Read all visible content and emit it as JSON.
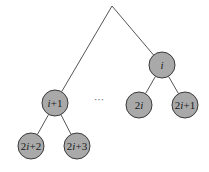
{
  "diagram": {
    "type": "binary-tree-fragment",
    "apex": {
      "x": 112,
      "y": 6
    },
    "nodes": [
      {
        "id": "n_i",
        "label_parts": [
          {
            "t": "i",
            "italic": true
          }
        ],
        "x": 162,
        "y": 65
      },
      {
        "id": "n_i1",
        "label_parts": [
          {
            "t": "i",
            "italic": true
          },
          {
            "t": "+1",
            "italic": false
          }
        ],
        "x": 55,
        "y": 103
      },
      {
        "id": "n_2i",
        "label_parts": [
          {
            "t": "2",
            "italic": false
          },
          {
            "t": "i",
            "italic": true
          }
        ],
        "x": 139,
        "y": 105
      },
      {
        "id": "n_2i1",
        "label_parts": [
          {
            "t": "2",
            "italic": false
          },
          {
            "t": "i",
            "italic": true
          },
          {
            "t": "+1",
            "italic": false
          }
        ],
        "x": 185,
        "y": 105
      },
      {
        "id": "n_2i2",
        "label_parts": [
          {
            "t": "2",
            "italic": false
          },
          {
            "t": "i",
            "italic": true
          },
          {
            "t": "+2",
            "italic": false
          }
        ],
        "x": 31,
        "y": 146
      },
      {
        "id": "n_2i3",
        "label_parts": [
          {
            "t": "2",
            "italic": false
          },
          {
            "t": "i",
            "italic": true
          },
          {
            "t": "+3",
            "italic": false
          }
        ],
        "x": 77,
        "y": 146
      }
    ],
    "labels": {
      "n_i": "i",
      "n_i1": "i+1",
      "n_2i": "2i",
      "n_2i1": "2i+1",
      "n_2i2": "2i+2",
      "n_2i3": "2i+3"
    },
    "edges": [
      {
        "from": "apex",
        "to": "n_i"
      },
      {
        "from": "apex",
        "to": "n_i1"
      },
      {
        "from": "n_i",
        "to": "n_2i"
      },
      {
        "from": "n_i",
        "to": "n_2i1"
      },
      {
        "from": "n_i1",
        "to": "n_2i2"
      },
      {
        "from": "n_i1",
        "to": "n_2i3"
      }
    ],
    "ellipsis": {
      "text": "···",
      "x": 99,
      "y": 103
    },
    "node_radius": 13,
    "colors": {
      "node_fill": "#a9a9a9",
      "node_stroke": "#3a3a3a",
      "edge": "#555555"
    }
  }
}
